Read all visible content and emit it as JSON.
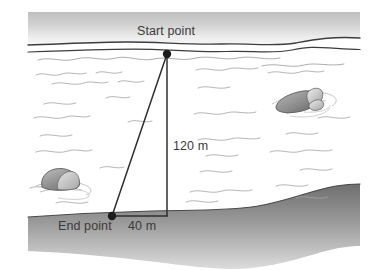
{
  "diagram": {
    "type": "right-triangle-scene",
    "labels": {
      "start_point": "Start point",
      "end_point": "End point",
      "base_length": "40 m",
      "height_length": "120 m"
    },
    "measurements": {
      "vertical_depth": 120,
      "horizontal_offset": 40,
      "unit": "m"
    },
    "scene_elements": {
      "sky_band": "shoreline-band",
      "water_surface": "water-surface-line",
      "water_body": "open-water",
      "seabed": "seabed-band",
      "rock_left": "submerged-rock-left",
      "rock_right": "submerged-rock-right"
    },
    "colors": {
      "sky_band_top": "#b4b4b4",
      "sky_band_bottom": "#f2f2f2",
      "seabed_top": "#6e6e6e",
      "seabed_bottom": "#d8d8d8",
      "outline": "#3b3b3b",
      "wave_line": "#9b9b9b",
      "rock_fill": "#9d9d9d",
      "text": "#3b3b3b",
      "background": "#ffffff"
    }
  }
}
